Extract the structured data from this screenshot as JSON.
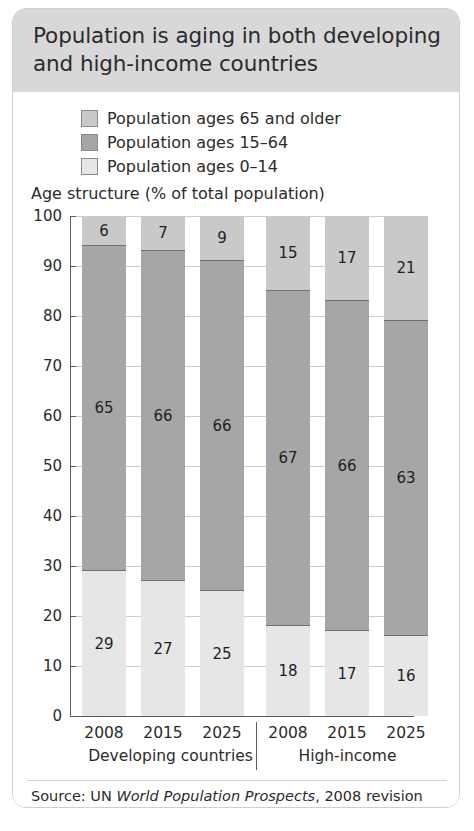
{
  "header": {
    "title": "Population is aging in both developing and high-income countries"
  },
  "legend": {
    "items": [
      {
        "label": "Population ages 65 and older",
        "color": "#c9c9c9",
        "key": "age65plus"
      },
      {
        "label": "Population ages 15–64",
        "color": "#a6a6a6",
        "key": "age15to64"
      },
      {
        "label": "Population ages 0–14",
        "color": "#e6e6e6",
        "key": "age0to14"
      }
    ]
  },
  "axis_caption": "Age structure (% of total population)",
  "groups": [
    {
      "label": "Developing countries",
      "years": [
        "2008",
        "2015",
        "2025"
      ]
    },
    {
      "label": "High-income",
      "years": [
        "2008",
        "2015",
        "2025"
      ]
    }
  ],
  "source": {
    "prefix": "Source: UN ",
    "title_italic": "World Population Prospects",
    "suffix": ", 2008 revision"
  },
  "chart_data": {
    "type": "bar",
    "stacked": true,
    "title": "Population is aging in both developing and high-income countries",
    "subtitle": "Age structure (% of total population)",
    "xlabel": "",
    "ylabel": "Age structure (% of total population)",
    "ylim": [
      0,
      100
    ],
    "yticks": [
      0,
      10,
      20,
      30,
      40,
      50,
      60,
      70,
      80,
      90,
      100
    ],
    "grid": true,
    "legend_position": "top-left",
    "categories": [
      "2008",
      "2015",
      "2025",
      "2008",
      "2015",
      "2025"
    ],
    "category_groups": [
      "Developing countries",
      "Developing countries",
      "Developing countries",
      "High-income",
      "High-income",
      "High-income"
    ],
    "series": [
      {
        "name": "Population ages 0–14",
        "color": "#e6e6e6",
        "values": [
          29,
          27,
          25,
          18,
          17,
          16
        ]
      },
      {
        "name": "Population ages 15–64",
        "color": "#a6a6a6",
        "values": [
          65,
          66,
          66,
          67,
          66,
          63
        ]
      },
      {
        "name": "Population ages 65 and older",
        "color": "#c9c9c9",
        "values": [
          6,
          7,
          9,
          15,
          17,
          21
        ]
      }
    ],
    "source": "Source: UN World Population Prospects, 2008 revision"
  }
}
